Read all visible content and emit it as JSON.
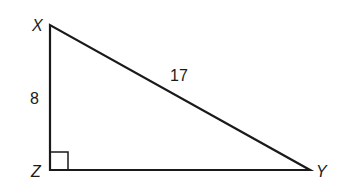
{
  "diagram": {
    "type": "right-triangle",
    "vertices": {
      "X": {
        "label": "X",
        "x": 50,
        "y": 25
      },
      "Z": {
        "label": "Z",
        "x": 50,
        "y": 170
      },
      "Y": {
        "label": "Y",
        "x": 310,
        "y": 170
      }
    },
    "sides": {
      "XZ": {
        "label": "8"
      },
      "XY": {
        "label": "17"
      },
      "ZY": {
        "label": ""
      }
    },
    "right_angle_at": "Z",
    "stroke_color": "#1a1a1a"
  }
}
